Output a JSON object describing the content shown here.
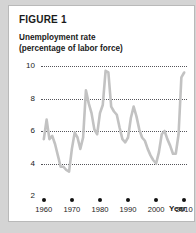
{
  "card": {
    "title": "FIGURE 1",
    "subtitle_line1": "Unemployment rate",
    "subtitle_line2": "(percentage of labor force)"
  },
  "colors": {
    "page_background": "#d4d4d4",
    "card_background": "#ffffff",
    "line": "#c2c2c2",
    "text": "#1a1a1a",
    "gridline": "#55555a",
    "marker": "#111111"
  },
  "chart_data": {
    "type": "line",
    "title": "FIGURE 1",
    "subtitle": "Unemployment rate (percentage of labor force)",
    "xlabel": "Year",
    "ylabel": "",
    "xlim": [
      1959,
      2011
    ],
    "ylim": [
      2,
      10
    ],
    "grid": true,
    "legend": null,
    "y_ticks": [
      10,
      8,
      6,
      4,
      2
    ],
    "x_ticks": [
      1960,
      1970,
      1980,
      1990,
      2000,
      2010
    ],
    "x_tick_labels": [
      "1960",
      "1970",
      "1980",
      "1990",
      "2000",
      "2010"
    ],
    "y_tick_labels": [
      "10",
      "8",
      "6",
      "4",
      "2"
    ],
    "series": [
      {
        "name": "Unemployment rate",
        "color": "#c2c2c2",
        "x": [
          1960,
          1961,
          1962,
          1963,
          1964,
          1965,
          1966,
          1967,
          1968,
          1969,
          1970,
          1971,
          1972,
          1973,
          1974,
          1975,
          1976,
          1977,
          1978,
          1979,
          1980,
          1981,
          1982,
          1983,
          1984,
          1985,
          1986,
          1987,
          1988,
          1989,
          1990,
          1991,
          1992,
          1993,
          1994,
          1995,
          1996,
          1997,
          1998,
          1999,
          2000,
          2001,
          2002,
          2003,
          2004,
          2005,
          2006,
          2007,
          2008,
          2009,
          2010
        ],
        "values": [
          5.5,
          6.7,
          5.5,
          5.7,
          5.2,
          4.5,
          3.8,
          3.8,
          3.6,
          3.5,
          4.9,
          5.9,
          5.6,
          4.9,
          5.6,
          8.5,
          7.7,
          7.1,
          6.1,
          5.8,
          7.1,
          7.6,
          9.7,
          9.6,
          7.5,
          7.2,
          7.0,
          6.2,
          5.5,
          5.3,
          5.6,
          6.8,
          7.5,
          6.9,
          6.1,
          5.6,
          5.4,
          4.9,
          4.5,
          4.2,
          4.0,
          4.7,
          5.8,
          6.0,
          5.5,
          5.1,
          4.6,
          4.6,
          5.8,
          9.3,
          9.6
        ]
      }
    ]
  }
}
